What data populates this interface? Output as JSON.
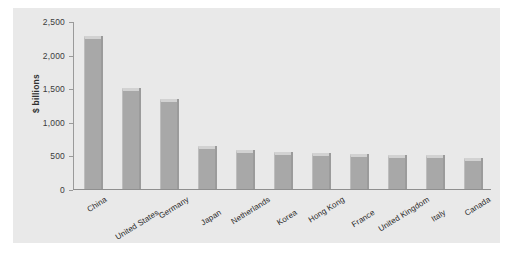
{
  "chart_data": {
    "type": "bar",
    "title": "",
    "xlabel": "",
    "ylabel": "$ billions",
    "ylim": [
      0,
      2500
    ],
    "grid": false,
    "legend": null,
    "ytick_labels": [
      "2,500",
      "2,000",
      "1,500",
      "1,000",
      "500",
      "0"
    ],
    "ytick_values": [
      2500,
      2000,
      1500,
      1000,
      500,
      0
    ],
    "categories": [
      "China",
      "United States",
      "Germany",
      "Japan",
      "Netherlands",
      "Korea",
      "Hong Kong",
      "France",
      "United Kingdom",
      "Italy",
      "Canada"
    ],
    "values": [
      2270,
      1510,
      1340,
      640,
      575,
      555,
      535,
      525,
      510,
      500,
      455
    ],
    "series": [
      {
        "name": "Exports",
        "values": [
          2270,
          1510,
          1340,
          640,
          575,
          555,
          535,
          525,
          510,
          500,
          455
        ]
      }
    ],
    "colors": {
      "bar_face": "#a8a8a8",
      "bar_top": "#d2d2d2",
      "panel_background": "#e9e9e9",
      "page_background": "#ffffff",
      "axis": "#9a9a9a",
      "text": "#2b2b2b"
    }
  }
}
